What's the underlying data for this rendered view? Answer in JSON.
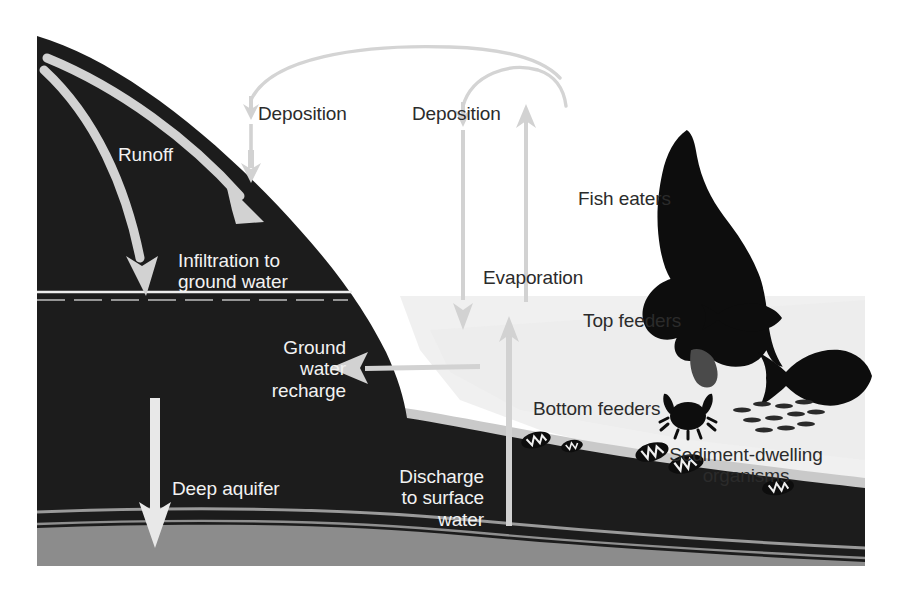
{
  "figure": {
    "type": "process-diagram"
  },
  "palette": {
    "background": "#ffffff",
    "ground_dark": "#1c1c1c",
    "aquifer_band_light": "#9a9a9a",
    "deep_layer_gray": "#8c8c8c",
    "water_body": "#f0f0f0",
    "sediment_gray": "#c8c8c8",
    "arrow_light": "#d2d2d2",
    "arrow_white": "#e8e8e8",
    "label_dark": "#2b2b2b",
    "label_light": "#f2f2f2",
    "silhouette": "#0d0d0d"
  },
  "labels": {
    "runoff": "Runoff",
    "infiltration": "Infiltration to\nground water",
    "deposition_left": "Deposition",
    "deposition_right": "Deposition",
    "evaporation": "Evaporation",
    "fish_eaters": "Fish eaters",
    "top_feeders": "Top feeders",
    "bottom_feeders": "Bottom feeders",
    "ground_water_recharge": "Ground\nwater\nrecharge",
    "discharge": "Discharge\nto surface\nwater",
    "sediment_dwelling": "Sediment-dwelling\norganisms",
    "deep_aquifer": "Deep aquifer"
  },
  "flows": [
    {
      "name": "runoff",
      "label": "Runoff",
      "direction": "downslope",
      "style": "curved-arrow",
      "color": "#d2d2d2"
    },
    {
      "name": "infiltration",
      "label": "Infiltration to ground water",
      "direction": "down",
      "style": "curved-arrow",
      "color": "#d2d2d2"
    },
    {
      "name": "deposition-left",
      "label": "Deposition",
      "direction": "down",
      "style": "straight-arrow",
      "color": "#d2d2d2"
    },
    {
      "name": "deposition-right",
      "label": "Deposition",
      "direction": "down",
      "style": "straight-arrow",
      "color": "#d2d2d2"
    },
    {
      "name": "evaporation",
      "label": "Evaporation",
      "direction": "up",
      "style": "straight-arrow",
      "color": "#d2d2d2"
    },
    {
      "name": "atmospheric-transport",
      "label": "",
      "direction": "arc",
      "style": "arc",
      "color": "#d2d2d2"
    },
    {
      "name": "ground-water-recharge",
      "label": "Ground water recharge",
      "direction": "left",
      "style": "straight-arrow",
      "color": "#d2d2d2"
    },
    {
      "name": "discharge-to-surface-water",
      "label": "Discharge to surface water",
      "direction": "up",
      "style": "straight-arrow",
      "color": "#d2d2d2"
    },
    {
      "name": "deep-aquifer",
      "label": "Deep aquifer",
      "direction": "down",
      "style": "straight-arrow",
      "color": "#e8e8e8"
    }
  ],
  "organisms": [
    {
      "name": "osprey",
      "label": "Fish eaters",
      "tier": "top-predator"
    },
    {
      "name": "small-fish",
      "label": "Top feeders",
      "tier": "surface"
    },
    {
      "name": "large-fish",
      "label": "",
      "tier": "water-column"
    },
    {
      "name": "crab",
      "label": "Bottom feeders",
      "tier": "benthic"
    },
    {
      "name": "fish-school",
      "label": "",
      "tier": "water-column"
    },
    {
      "name": "benthic-invertebrates",
      "label": "Sediment-dwelling organisms",
      "tier": "sediment"
    }
  ]
}
